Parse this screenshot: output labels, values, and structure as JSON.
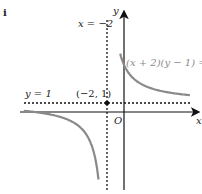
{
  "part_label": "i",
  "axes": {
    "x_label": "x",
    "y_label": "y",
    "origin_label": "O"
  },
  "asymptotes": {
    "vertical": "x = −2",
    "horizontal": "y = 1"
  },
  "point_label": "(−2, 1)",
  "curve_equation": "(x + 2)(y − 1) = 9",
  "colors": {
    "curve": "#8a8a8a",
    "axes": "#111111"
  }
}
